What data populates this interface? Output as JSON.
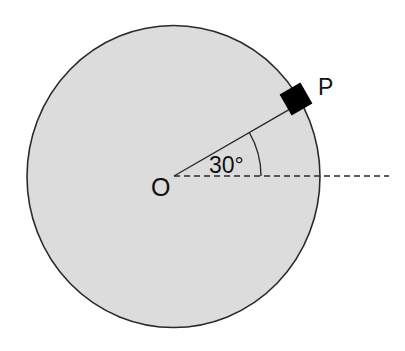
{
  "diagram": {
    "center_label": "O",
    "block_label": "P",
    "angle_label": "30°",
    "angle_degrees": 30,
    "colors": {
      "disc_fill": "#dcdcdc",
      "stroke": "#2a2a2a",
      "block": "#000000",
      "background": "#ffffff"
    },
    "elements": [
      {
        "type": "disc",
        "description": "circular disc centered at O, gray fill"
      },
      {
        "type": "radius_line",
        "description": "solid line from O to block P at 30° above horizontal"
      },
      {
        "type": "reference_line",
        "description": "horizontal dashed line from O extending beyond disc edge"
      },
      {
        "type": "angle_arc",
        "description": "arc marking 30° between dashed line and radius"
      },
      {
        "type": "block",
        "description": "small black square block P on the disc rim"
      }
    ]
  }
}
